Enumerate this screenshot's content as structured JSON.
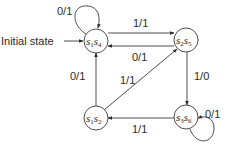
{
  "diagram": {
    "type": "state-machine",
    "initial_label": "Initial state",
    "states": [
      {
        "id": "s1s4",
        "parts": [
          {
            "s": "s",
            "sub": "1"
          },
          {
            "s": "s",
            "sub": "4"
          }
        ],
        "initial": true
      },
      {
        "id": "s2s5",
        "parts": [
          {
            "s": "s",
            "sub": "2"
          },
          {
            "s": "s",
            "sub": "5"
          }
        ]
      },
      {
        "id": "s1s2",
        "parts": [
          {
            "s": "s",
            "sub": "1"
          },
          {
            "s": "s",
            "sub": "2"
          }
        ]
      },
      {
        "id": "s3s6",
        "parts": [
          {
            "s": "s",
            "sub": "3"
          },
          {
            "s": "s",
            "sub": "6"
          }
        ]
      }
    ],
    "transitions": [
      {
        "id": "t-s1s4-self",
        "from": "s1s4",
        "to": "s1s4",
        "label": "0/1"
      },
      {
        "id": "t-s1s4-s2s5",
        "from": "s1s4",
        "to": "s2s5",
        "label": "1/1"
      },
      {
        "id": "t-s2s5-s1s4",
        "from": "s2s5",
        "to": "s1s4",
        "label": "0/1"
      },
      {
        "id": "t-s2s5-s3s6",
        "from": "s2s5",
        "to": "s3s6",
        "label": "1/0"
      },
      {
        "id": "t-s3s6-self",
        "from": "s3s6",
        "to": "s3s6",
        "label": "0/1"
      },
      {
        "id": "t-s3s6-s1s2",
        "from": "s3s6",
        "to": "s1s2",
        "label": "1/1"
      },
      {
        "id": "t-s1s2-s1s4",
        "from": "s1s2",
        "to": "s1s4",
        "label": "0/1"
      },
      {
        "id": "t-s1s2-s2s5",
        "from": "s1s2",
        "to": "s2s5",
        "label": "1/1"
      }
    ]
  }
}
